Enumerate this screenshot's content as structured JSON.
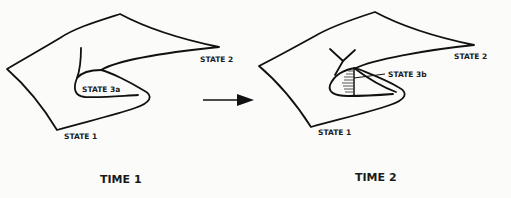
{
  "diagram": {
    "panels": [
      {
        "caption": "TIME 1",
        "labels": {
          "state1": "STATE 1",
          "state2": "STATE 2",
          "state3": "STATE 3a"
        }
      },
      {
        "caption": "TIME 2",
        "labels": {
          "state1": "STATE 1",
          "state2": "STATE 2",
          "state3": "STATE 3b"
        }
      }
    ],
    "transition_arrow": "right-arrow-icon",
    "colors": {
      "ink": "#111111",
      "background": "#fbfbf9"
    }
  }
}
